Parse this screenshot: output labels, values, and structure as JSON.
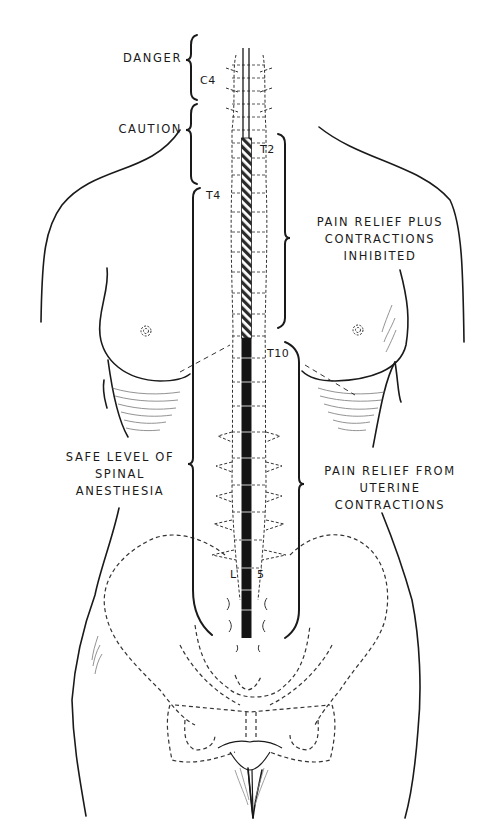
{
  "figure": {
    "colors": {
      "ink": "#1a1a1a",
      "background": "#ffffff",
      "hatch": "#333333"
    }
  },
  "labels": {
    "danger": "DANGER",
    "caution": "CAUTION",
    "pain_relief_plus_line1": "PAIN RELIEF PLUS",
    "pain_relief_plus_line2": "CONTRACTIONS",
    "pain_relief_plus_line3": "INHIBITED",
    "safe_level_line1": "SAFE LEVEL OF",
    "safe_level_line2": "SPINAL",
    "safe_level_line3": "ANESTHESIA",
    "pain_relief_from_line1": "PAIN RELIEF FROM",
    "pain_relief_from_line2": "UTERINE",
    "pain_relief_from_line3": "CONTRACTIONS"
  },
  "vertebra_markers": {
    "c4": "C4",
    "t2": "T2",
    "t4": "T4",
    "t10": "T10",
    "l5_left": "L",
    "l5_right": "5"
  },
  "zones": [
    {
      "name": "Danger",
      "from": "top",
      "to": "C4",
      "style": "bracket"
    },
    {
      "name": "Caution",
      "from": "C4",
      "to": "T4",
      "style": "bracket"
    },
    {
      "name": "Pain relief plus contractions inhibited",
      "from": "T2",
      "to": "T10",
      "style": "hatched"
    },
    {
      "name": "Safe level of spinal anesthesia",
      "from": "T4",
      "to": "L5",
      "style": "bracket"
    },
    {
      "name": "Pain relief from uterine contractions",
      "from": "T10",
      "to": "sacrum",
      "style": "solid"
    }
  ]
}
